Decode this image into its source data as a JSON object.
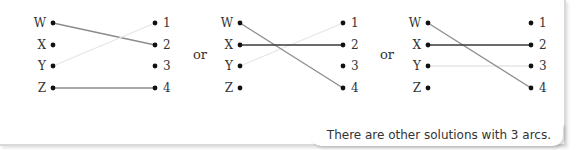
{
  "diagrams": [
    {
      "left_nodes": [
        "W",
        "X",
        "Y",
        "Z"
      ],
      "right_nodes": [
        "1",
        "2",
        "3",
        "4"
      ],
      "arcs": [
        {
          "from": "W",
          "to": "2",
          "weight": "medium"
        },
        {
          "from": "Y",
          "to": "1",
          "weight": "light"
        },
        {
          "from": "Z",
          "to": "4",
          "weight": "medium"
        }
      ]
    },
    {
      "left_nodes": [
        "W",
        "X",
        "Y",
        "Z"
      ],
      "right_nodes": [
        "1",
        "2",
        "3",
        "4"
      ],
      "arcs": [
        {
          "from": "W",
          "to": "4",
          "weight": "medium"
        },
        {
          "from": "X",
          "to": "2",
          "weight": "dark"
        },
        {
          "from": "Y",
          "to": "1",
          "weight": "light"
        }
      ]
    },
    {
      "left_nodes": [
        "W",
        "X",
        "Y",
        "Z"
      ],
      "right_nodes": [
        "1",
        "2",
        "3",
        "4"
      ],
      "arcs": [
        {
          "from": "W",
          "to": "4",
          "weight": "medium"
        },
        {
          "from": "X",
          "to": "2",
          "weight": "dark"
        },
        {
          "from": "Y",
          "to": "3",
          "weight": "light"
        }
      ]
    }
  ],
  "separators": [
    "or",
    "or"
  ],
  "callout": "There are other solutions with 3 arcs.",
  "colors": {
    "light": "#e6e6e6",
    "medium": "#8c8c8c",
    "dark": "#3a3a3a",
    "node": "#111111"
  }
}
